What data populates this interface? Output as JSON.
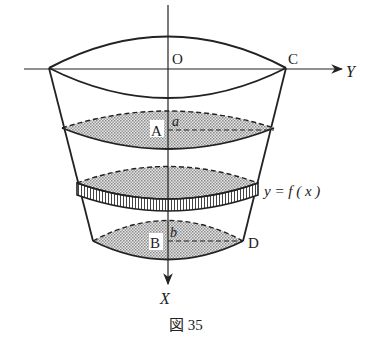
{
  "figure": {
    "caption": "図 35",
    "labels": {
      "origin": "O",
      "point_c": "C",
      "point_a": "A",
      "var_a": "a",
      "point_b": "B",
      "var_b": "b",
      "point_d": "D",
      "axis_y": "Y",
      "axis_x": "X",
      "curve": "y = f ( x )"
    },
    "colors": {
      "ink": "#222222",
      "shade": "#c8c8c8",
      "background": "#ffffff"
    }
  }
}
